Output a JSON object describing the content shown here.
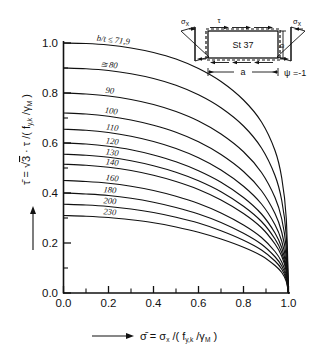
{
  "figure": {
    "background": "#ffffff",
    "ink": "#111111"
  },
  "axes": {
    "x_ticklabels": [
      "0.0",
      "0.2",
      "0.4",
      "0.6",
      "0.8",
      "1.0"
    ],
    "y_ticklabels": [
      "0.0",
      "0.2",
      "0.4",
      "0.6",
      "0.8",
      "1.0"
    ],
    "x_title_parts": {
      "bar": "σ̄",
      "eq": " = ",
      "sigma": "σ",
      "sigma_sub": "x",
      "slash": " /( f",
      "f_sub": "y,k",
      "mid": " /γ",
      "gamma_sub": "M",
      "close": " )"
    },
    "y_title_parts": {
      "bar": "τ̄",
      "eq": " = ",
      "root": "√",
      "three": "3",
      "dot": " · ",
      "tau": "τ",
      "slash": " /( f",
      "f_sub": "y,k",
      "mid": " /γ",
      "gamma_sub": "M",
      "close": " )"
    }
  },
  "chart_data": {
    "type": "line",
    "title": "",
    "xlabel": "σ̄ = σx/(fy,k/γM)",
    "ylabel": "τ̄ = √3·τ/(fy,k/γM)",
    "xlim": [
      0.0,
      1.0
    ],
    "ylim": [
      0.0,
      1.0
    ],
    "xticks": [
      0.0,
      0.2,
      0.4,
      0.6,
      0.8,
      1.0
    ],
    "yticks": [
      0.0,
      0.2,
      0.4,
      0.6,
      0.8,
      1.0
    ],
    "grid": false,
    "legend": "inline curve labels",
    "series": [
      {
        "name": "b/t ≤ 71,9",
        "label": "b/t ≤ 71,9",
        "y0": 1.0,
        "x_end": 1.0,
        "points": [
          [
            0.0,
            1.0
          ],
          [
            0.1,
            0.998
          ],
          [
            0.2,
            0.992
          ],
          [
            0.3,
            0.98
          ],
          [
            0.4,
            0.962
          ],
          [
            0.5,
            0.936
          ],
          [
            0.6,
            0.898
          ],
          [
            0.7,
            0.846
          ],
          [
            0.8,
            0.772
          ],
          [
            0.88,
            0.684
          ],
          [
            0.94,
            0.57
          ],
          [
            0.97,
            0.46
          ],
          [
            0.99,
            0.3
          ],
          [
            1.0,
            0.0
          ]
        ]
      },
      {
        "name": "80",
        "label": "≅ 80",
        "y0": 0.9,
        "x_end": 1.0,
        "points": [
          [
            0.0,
            0.9
          ],
          [
            0.1,
            0.897
          ],
          [
            0.2,
            0.89
          ],
          [
            0.3,
            0.877
          ],
          [
            0.4,
            0.858
          ],
          [
            0.5,
            0.831
          ],
          [
            0.6,
            0.793
          ],
          [
            0.7,
            0.741
          ],
          [
            0.8,
            0.668
          ],
          [
            0.88,
            0.58
          ],
          [
            0.94,
            0.47
          ],
          [
            0.97,
            0.37
          ],
          [
            0.99,
            0.23
          ],
          [
            1.0,
            0.0
          ]
        ]
      },
      {
        "name": "90",
        "label": "90",
        "y0": 0.8,
        "x_end": 1.0,
        "points": [
          [
            0.0,
            0.8
          ],
          [
            0.1,
            0.796
          ],
          [
            0.2,
            0.788
          ],
          [
            0.3,
            0.774
          ],
          [
            0.4,
            0.754
          ],
          [
            0.5,
            0.726
          ],
          [
            0.6,
            0.688
          ],
          [
            0.7,
            0.636
          ],
          [
            0.8,
            0.565
          ],
          [
            0.88,
            0.482
          ],
          [
            0.94,
            0.382
          ],
          [
            0.97,
            0.296
          ],
          [
            0.99,
            0.18
          ],
          [
            1.0,
            0.0
          ]
        ]
      },
      {
        "name": "100",
        "label": "100",
        "y0": 0.72,
        "x_end": 1.0,
        "points": [
          [
            0.0,
            0.72
          ],
          [
            0.1,
            0.716
          ],
          [
            0.2,
            0.707
          ],
          [
            0.3,
            0.692
          ],
          [
            0.4,
            0.671
          ],
          [
            0.5,
            0.643
          ],
          [
            0.6,
            0.605
          ],
          [
            0.7,
            0.554
          ],
          [
            0.8,
            0.486
          ],
          [
            0.88,
            0.409
          ],
          [
            0.94,
            0.318
          ],
          [
            0.97,
            0.243
          ],
          [
            0.99,
            0.146
          ],
          [
            1.0,
            0.0
          ]
        ]
      },
      {
        "name": "110",
        "label": "110",
        "y0": 0.655,
        "x_end": 1.0,
        "points": [
          [
            0.0,
            0.655
          ],
          [
            0.1,
            0.651
          ],
          [
            0.2,
            0.642
          ],
          [
            0.3,
            0.627
          ],
          [
            0.4,
            0.606
          ],
          [
            0.5,
            0.578
          ],
          [
            0.6,
            0.541
          ],
          [
            0.7,
            0.492
          ],
          [
            0.8,
            0.427
          ],
          [
            0.88,
            0.356
          ],
          [
            0.94,
            0.273
          ],
          [
            0.97,
            0.207
          ],
          [
            0.99,
            0.123
          ],
          [
            1.0,
            0.0
          ]
        ]
      },
      {
        "name": "120",
        "label": "120",
        "y0": 0.6,
        "x_end": 1.0,
        "points": [
          [
            0.0,
            0.6
          ],
          [
            0.1,
            0.596
          ],
          [
            0.2,
            0.587
          ],
          [
            0.3,
            0.573
          ],
          [
            0.4,
            0.552
          ],
          [
            0.5,
            0.525
          ],
          [
            0.6,
            0.489
          ],
          [
            0.7,
            0.443
          ],
          [
            0.8,
            0.382
          ],
          [
            0.88,
            0.316
          ],
          [
            0.94,
            0.24
          ],
          [
            0.97,
            0.181
          ],
          [
            0.99,
            0.107
          ],
          [
            1.0,
            0.0
          ]
        ]
      },
      {
        "name": "130",
        "label": "130",
        "y0": 0.555,
        "x_end": 1.0,
        "points": [
          [
            0.0,
            0.555
          ],
          [
            0.1,
            0.551
          ],
          [
            0.2,
            0.543
          ],
          [
            0.3,
            0.529
          ],
          [
            0.4,
            0.509
          ],
          [
            0.5,
            0.483
          ],
          [
            0.6,
            0.449
          ],
          [
            0.7,
            0.405
          ],
          [
            0.8,
            0.347
          ],
          [
            0.88,
            0.286
          ],
          [
            0.94,
            0.216
          ],
          [
            0.97,
            0.162
          ],
          [
            0.99,
            0.095
          ],
          [
            1.0,
            0.0
          ]
        ]
      },
      {
        "name": "140",
        "label": "140",
        "y0": 0.515,
        "x_end": 1.0,
        "points": [
          [
            0.0,
            0.515
          ],
          [
            0.1,
            0.511
          ],
          [
            0.2,
            0.503
          ],
          [
            0.3,
            0.49
          ],
          [
            0.4,
            0.471
          ],
          [
            0.5,
            0.446
          ],
          [
            0.6,
            0.414
          ],
          [
            0.7,
            0.372
          ],
          [
            0.8,
            0.318
          ],
          [
            0.88,
            0.261
          ],
          [
            0.94,
            0.196
          ],
          [
            0.97,
            0.147
          ],
          [
            0.99,
            0.086
          ],
          [
            1.0,
            0.0
          ]
        ]
      },
      {
        "name": "160",
        "label": "160",
        "y0": 0.45,
        "x_end": 1.0,
        "points": [
          [
            0.0,
            0.45
          ],
          [
            0.1,
            0.446
          ],
          [
            0.2,
            0.439
          ],
          [
            0.3,
            0.427
          ],
          [
            0.4,
            0.41
          ],
          [
            0.5,
            0.387
          ],
          [
            0.6,
            0.358
          ],
          [
            0.7,
            0.32
          ],
          [
            0.8,
            0.272
          ],
          [
            0.88,
            0.222
          ],
          [
            0.94,
            0.166
          ],
          [
            0.97,
            0.124
          ],
          [
            0.99,
            0.072
          ],
          [
            1.0,
            0.0
          ]
        ]
      },
      {
        "name": "180",
        "label": "180",
        "y0": 0.4,
        "x_end": 1.0,
        "points": [
          [
            0.0,
            0.4
          ],
          [
            0.1,
            0.396
          ],
          [
            0.2,
            0.39
          ],
          [
            0.3,
            0.379
          ],
          [
            0.4,
            0.363
          ],
          [
            0.5,
            0.342
          ],
          [
            0.6,
            0.316
          ],
          [
            0.7,
            0.282
          ],
          [
            0.8,
            0.239
          ],
          [
            0.88,
            0.195
          ],
          [
            0.94,
            0.145
          ],
          [
            0.97,
            0.108
          ],
          [
            0.99,
            0.063
          ],
          [
            1.0,
            0.0
          ]
        ]
      },
      {
        "name": "200",
        "label": "200",
        "y0": 0.355,
        "x_end": 1.0,
        "points": [
          [
            0.0,
            0.355
          ],
          [
            0.1,
            0.352
          ],
          [
            0.2,
            0.346
          ],
          [
            0.3,
            0.336
          ],
          [
            0.4,
            0.322
          ],
          [
            0.5,
            0.303
          ],
          [
            0.6,
            0.28
          ],
          [
            0.7,
            0.249
          ],
          [
            0.8,
            0.211
          ],
          [
            0.88,
            0.172
          ],
          [
            0.94,
            0.128
          ],
          [
            0.97,
            0.095
          ],
          [
            0.99,
            0.055
          ],
          [
            1.0,
            0.0
          ]
        ]
      },
      {
        "name": "230",
        "label": "230",
        "y0": 0.31,
        "x_end": 1.0,
        "points": [
          [
            0.0,
            0.31
          ],
          [
            0.1,
            0.307
          ],
          [
            0.2,
            0.302
          ],
          [
            0.3,
            0.293
          ],
          [
            0.4,
            0.281
          ],
          [
            0.5,
            0.264
          ],
          [
            0.6,
            0.243
          ],
          [
            0.7,
            0.216
          ],
          [
            0.8,
            0.183
          ],
          [
            0.88,
            0.149
          ],
          [
            0.94,
            0.11
          ],
          [
            0.97,
            0.082
          ],
          [
            0.99,
            0.047
          ],
          [
            1.0,
            0.0
          ]
        ]
      }
    ]
  },
  "inset": {
    "material": "St 37",
    "tau_label": "τ",
    "sigma_left": "σ",
    "sigma_left_sub": "x",
    "sigma_right": "σ",
    "sigma_right_sub": "x",
    "dim_a": "a",
    "dim_b": "b",
    "psi": "ψ =-1"
  }
}
